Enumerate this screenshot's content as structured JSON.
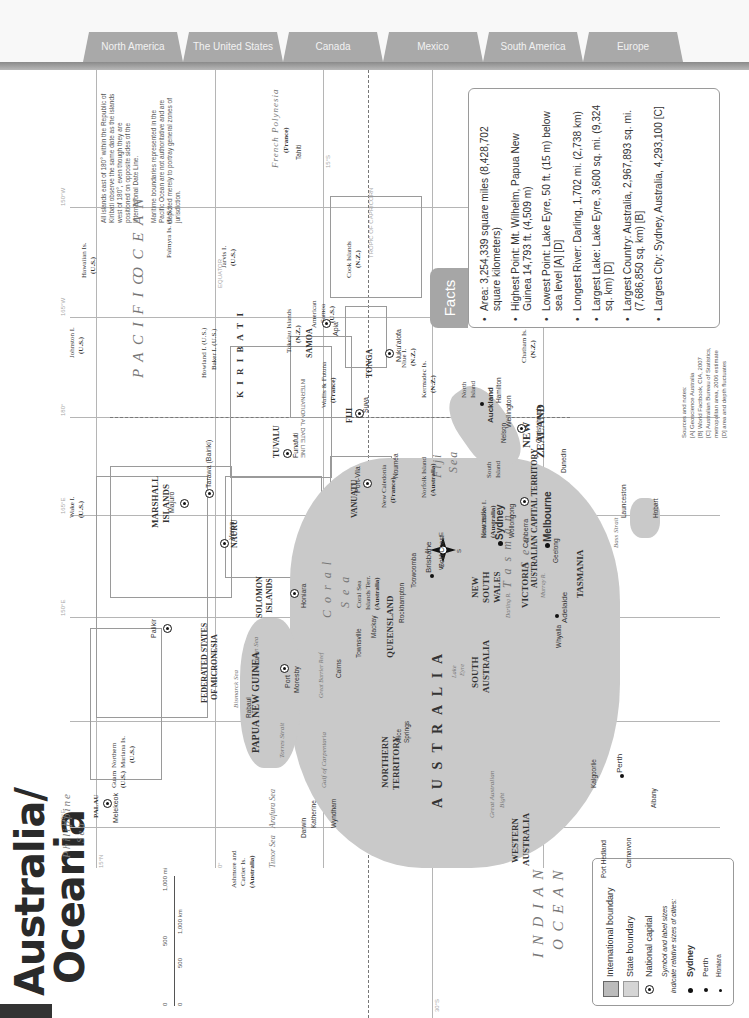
{
  "tabs": [
    {
      "label": "North America"
    },
    {
      "label": "The United States"
    },
    {
      "label": "Canada"
    },
    {
      "label": "Mexico"
    },
    {
      "label": "South America"
    },
    {
      "label": "Europe"
    }
  ],
  "page": {
    "title_line1": "Australia/",
    "title_line2": "Oceania"
  },
  "facts": {
    "heading": "Facts",
    "items": [
      "Area: 3,254,339 square miles (8,428,702 square kilometers)",
      "Highest Point: Mt. Wilhelm, Papua New Guinea 14,793 ft. (4,509 m)",
      "Lowest Point: Lake Eyre, 50 ft. (15 m) below sea level [A] [D]",
      "Longest River: Darling, 1,702 mi. (2,738 km)",
      "Largest Lake: Lake Eyre, 3,600 sq. mi. (9,324 sq. km) [D]",
      "Largest Country: Australia, 2,967,893 sq. mi. (7,686,850 sq. km) [B]",
      "Largest City: Sydney, Australia, 4,293,100 [C]"
    ]
  },
  "sources": {
    "heading": "Sources and notes:",
    "lines": [
      "[A] Geoscience Australia",
      "[B] World Factbook, CIA, 2007",
      "[C] Australian Bureau of Statistics, metropolitan area, 2006 estimate",
      "[D] area and depth fluctuates"
    ]
  },
  "notes": {
    "date_line": "All islands east of 180° within the Republic of Kiribati observe the same date as the islands west of 180°, even though they are positioned on opposite sides of the International Date Line.",
    "maritime": "Maritime boundaries represented in the Pacific Ocean are not authoritative and are depicted merely to portray general zones of jurisdiction."
  },
  "legend": {
    "international": "International boundary",
    "state": "State boundary",
    "capital": "National capital",
    "size_note_1": "Symbol and label sizes",
    "size_note_2": "indicate relative sizes of cities:",
    "city_large": "Sydney",
    "city_medium": "Perth",
    "city_small": "Honiara"
  },
  "scale": {
    "mi_0": "0",
    "mi_500": "500",
    "mi_1000": "1,000 mi",
    "km_0": "0",
    "km_500": "500",
    "km_1000": "1,000 km"
  },
  "grid_labels": {
    "lat_15n": "15°N",
    "lat_0": "0°",
    "lat_15s": "15°S",
    "lat_30s": "30°S",
    "lat_45s": "45°S",
    "lon_120e": "120°E",
    "lon_135e": "135°E",
    "lon_150e": "150°E",
    "lon_165e": "165°E",
    "lon_180": "180°",
    "lon_165w": "165°W",
    "lon_150w": "150°W",
    "equator": "EQUATOR",
    "tropic": "TROPIC OF CAPRICORN",
    "idl": "INTERNATIONAL DATE LINE"
  },
  "map": {
    "oceans": {
      "pacific_1": "P A C I F I C",
      "pacific_2": "O C E A N",
      "indian_1": "I N D I A N",
      "indian_2": "O C E A N",
      "philippine_1": "Philippine",
      "philippine_2": "Sea",
      "coral_1": "C o r a l",
      "coral_2": "S e a",
      "tasman_1": "T a s m a n",
      "tasman_2": "S e a",
      "fiji_1": "Fiji",
      "fiji_2": "Sea",
      "timor": "Timor Sea",
      "arafura": "Arafura Sea",
      "solomon": "Solomon Sea",
      "bismarck": "Bismarck Sea",
      "gulf_carpentaria": "Gulf of Carpentaria",
      "great_bight_1": "Great Australian",
      "great_bight_2": "Bight",
      "torres": "Torres Strait",
      "bass": "Bass Strait",
      "gbr": "Great Barrier Reef"
    },
    "countries": {
      "australia": "A U S T R A L I A",
      "png": "PAPUA NEW GUINEA",
      "fsm_1": "FEDERATED STATES",
      "fsm_2": "OF MICRONESIA",
      "marshall_1": "MARSHALL",
      "marshall_2": "ISLANDS",
      "solomon_1": "SOLOMON",
      "solomon_2": "ISLANDS",
      "nauru": "NAURU",
      "kiribati": "K I R I B A T I",
      "tuvalu": "TUVALU",
      "vanuatu": "VANUATU",
      "fiji": "FIJI",
      "samoa": "SAMOA",
      "tonga": "TONGA",
      "palau": "PALAU",
      "nz_1": "NEW",
      "nz_2": "ZEALAND"
    },
    "states": {
      "wa_1": "WESTERN",
      "wa_2": "AUSTRALIA",
      "nt_1": "NORTHERN",
      "nt_2": "TERRITORY",
      "sa_1": "SOUTH",
      "sa_2": "AUSTRALIA",
      "qld": "QUEENSLAND",
      "nsw_1": "NEW",
      "nsw_2": "SOUTH",
      "nsw_3": "WALES",
      "vic": "VICTORIA",
      "tas": "TASMANIA",
      "act": "AUSTRALIAN CAPITAL TERRITORY"
    },
    "territories": {
      "northern_mariana_1": "Northern",
      "northern_mariana_2": "Mariana Is.",
      "northern_mariana_3": "(U.S.)",
      "guam_1": "Guam",
      "guam_2": "(U.S.)",
      "wake_1": "Wake I.",
      "wake_2": "(U.S.)",
      "johnston_1": "Johnston I.",
      "johnston_2": "(U.S.)",
      "hawaiian_1": "Hawaiian Is.",
      "hawaiian_2": "(U.S.)",
      "palmyra": "Palmyra Is. (U.S.)",
      "jarvis_1": "Jarvis I.",
      "jarvis_2": "(U.S.)",
      "howland": "Howland I. (U.S.)",
      "baker": "Baker I. (U.S.)",
      "tokelau_1": "Tokelau Islands",
      "tokelau_2": "(N.Z.)",
      "am_samoa_1": "American",
      "am_samoa_2": "Samoa",
      "am_samoa_3": "(U.S.)",
      "cook_1": "Cook Islands",
      "cook_2": "(N.Z.)",
      "niue_1": "Niue I.",
      "niue_2": "(N.Z.)",
      "wallis_1": "Wallis & Futuna",
      "wallis_2": "(France)",
      "fr_poly_1": "French Polynesia",
      "fr_poly_2": "(France)",
      "new_cal_1": "New Caledonia",
      "new_cal_2": "(France)",
      "coral_isl_1": "Coral Sea",
      "coral_isl_2": "Islands Terr.",
      "coral_isl_3": "(Australia)",
      "norfolk_1": "Norfolk Island",
      "norfolk_2": "(Australia)",
      "lord_howe_1": "Lord Howe I.",
      "lord_howe_2": "(Australia)",
      "kermadec_1": "Kermadec Is.",
      "kermadec_2": "(N.Z.)",
      "chatham_1": "Chatham Is.",
      "chatham_2": "(N.Z.)",
      "ashmore_1": "Ashmore and",
      "ashmore_2": "Cartier Is.",
      "ashmore_3": "(Australia)",
      "north_island_1": "North",
      "north_island_2": "Island",
      "south_island_1": "South",
      "south_island_2": "Island"
    },
    "capitals": {
      "canberra": "Canberra",
      "wellington": "Wellington",
      "port_moresby_1": "Port",
      "port_moresby_2": "Moresby",
      "honiara": "Honiara",
      "palikir": "Palikir",
      "majuro": "Majuro",
      "tarawa": "Tarawa (Bairiki)",
      "yaren": "Yaren",
      "funafuti": "Funafuti",
      "port_vila": "Port-Vila",
      "suva": "Suva",
      "apia": "Apia",
      "nukualofa": "Nuku'alofa",
      "melekeok": "Melekeok"
    },
    "cities": {
      "sydney": "Sydney",
      "melbourne": "Melbourne",
      "brisbane": "Brisbane",
      "perth": "Perth",
      "adelaide": "Adelaide",
      "auckland": "Auckland",
      "gold_coast": "Gold Coast",
      "newcastle": "Newcastle",
      "wollongong": "Wollongong",
      "geelong": "Geelong",
      "hobart": "Hobart",
      "launceston": "Launceston",
      "toowoomba": "Toowoomba",
      "rockhampton": "Rockhampton",
      "mackay": "Mackay",
      "townsville": "Townsville",
      "cairns": "Cairns",
      "darwin": "Darwin",
      "katherine": "Katherine",
      "alice_1": "Alice",
      "alice_2": "Springs",
      "whyalla": "Whyalla",
      "kalgoorlie": "Kalgoorlie",
      "albany": "Albany",
      "port_hedland": "Port Hedland",
      "carnarvon": "Carnarvon",
      "wyndham": "Wyndham",
      "rabaul": "Rabaul",
      "noumea": "Nouméa",
      "hamilton": "Hamilton",
      "christchurch": "Christchurch",
      "dunedin": "Dunedin",
      "nelson": "Nelson",
      "tahiti": "Tahiti",
      "lake_eyre_1": "Lake",
      "lake_eyre_2": "Eyre",
      "darling_r": "Darling R.",
      "murray_r": "Murray R."
    }
  },
  "compass": {
    "n": "N",
    "s": "S",
    "e": "E",
    "w": "W"
  }
}
